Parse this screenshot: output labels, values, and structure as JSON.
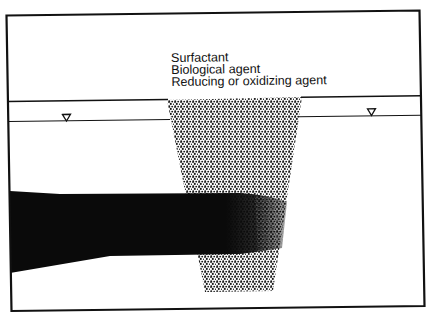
{
  "diagram": {
    "type": "permeable reactive barrier cross-section",
    "labels": {
      "line1": "Surfactant",
      "line2": "Biological agent",
      "line3": "Reducing or oxidizing agent"
    },
    "elements": {
      "frame": "border",
      "ground_surface": "horizontal line",
      "water_table": "horizontal line with water-table triangle markers",
      "water_table_markers": [
        "water-table-triangle-left",
        "water-table-triangle-right"
      ],
      "treatment_zone": "trapezoidal stippled trench",
      "contaminant_plume": "solid black plume entering trench from left, fading at right"
    },
    "colors": {
      "ink": "#111111",
      "background": "#ffffff",
      "plume": "#0a0a0a"
    }
  }
}
